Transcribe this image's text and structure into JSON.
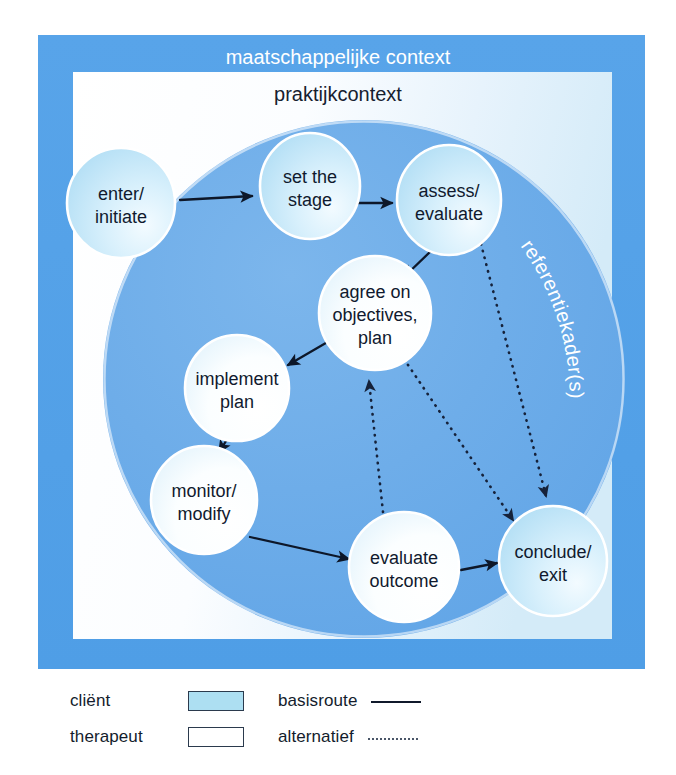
{
  "diagram": {
    "title_outer": "maatschappelijke context",
    "title_inner": "praktijkcontext",
    "title_ring": "referentiekader(s)",
    "nodes": [
      {
        "id": "enter",
        "label_line1": "enter/",
        "label_line2": "initiate",
        "role": "client",
        "cx": 121,
        "cy": 203,
        "rx": 54,
        "ry": 55
      },
      {
        "id": "stage",
        "label_line1": "set the",
        "label_line2": "stage",
        "role": "client",
        "cx": 310,
        "cy": 186,
        "rx": 50,
        "ry": 53
      },
      {
        "id": "assess",
        "label_line1": "assess/",
        "label_line2": "evaluate",
        "role": "client",
        "cx": 449,
        "cy": 200,
        "rx": 52,
        "ry": 55
      },
      {
        "id": "agree",
        "label_line1": "agree on",
        "label_line2": "objectives,",
        "label_line3": "plan",
        "role": "therapist",
        "cx": 375,
        "cy": 313,
        "rx": 56,
        "ry": 57
      },
      {
        "id": "implement",
        "label_line1": "implement",
        "label_line2": "plan",
        "role": "therapist",
        "cx": 237,
        "cy": 388,
        "rx": 52,
        "ry": 53
      },
      {
        "id": "monitor",
        "label_line1": "monitor/",
        "label_line2": "modify",
        "role": "therapist",
        "cx": 204,
        "cy": 500,
        "rx": 53,
        "ry": 54
      },
      {
        "id": "evaluate",
        "label_line1": "evaluate",
        "label_line2": "outcome",
        "role": "therapist",
        "cx": 404,
        "cy": 567,
        "rx": 55,
        "ry": 55
      },
      {
        "id": "conclude",
        "label_line1": "conclude/",
        "label_line2": "exit",
        "role": "client",
        "cx": 553,
        "cy": 561,
        "rx": 54,
        "ry": 55
      }
    ],
    "edges": [
      {
        "id": "enter-stage",
        "from": "enter",
        "to": "stage",
        "style": "basisroute"
      },
      {
        "id": "stage-assess",
        "from": "stage",
        "to": "assess",
        "style": "basisroute"
      },
      {
        "id": "assess-agree",
        "from": "assess",
        "to": "agree",
        "style": "basisroute"
      },
      {
        "id": "agree-implement",
        "from": "agree",
        "to": "implement",
        "style": "basisroute"
      },
      {
        "id": "implement-monitor",
        "from": "implement",
        "to": "monitor",
        "style": "basisroute"
      },
      {
        "id": "monitor-evaluate",
        "from": "monitor",
        "to": "evaluate",
        "style": "basisroute"
      },
      {
        "id": "evaluate-conclude",
        "from": "evaluate",
        "to": "conclude",
        "style": "basisroute"
      },
      {
        "id": "evaluate-agree",
        "from": "evaluate",
        "to": "agree",
        "style": "alternatief"
      },
      {
        "id": "agree-conclude",
        "from": "agree",
        "to": "conclude",
        "style": "alternatief"
      },
      {
        "id": "assess-conclude",
        "from": "assess",
        "to": "conclude",
        "style": "alternatief"
      }
    ]
  },
  "legend": {
    "rows": [
      {
        "label": "cliënt",
        "swatch": "filled",
        "line_label": "basisroute",
        "line_style": "solid"
      },
      {
        "label": "therapeut",
        "swatch": "empty",
        "line_label": "alternatief",
        "line_style": "dotted"
      }
    ]
  },
  "colors": {
    "frame_blue": "#55a2e8",
    "inner_light": "#dff0fb",
    "inner_white": "#ffffff",
    "circle_blue": "#6eadea",
    "node_client": "#bfe4f7",
    "node_therapist": "#ffffff",
    "text_dark": "#101a2e",
    "text_white": "#ffffff",
    "arrow": "#0d1729"
  }
}
